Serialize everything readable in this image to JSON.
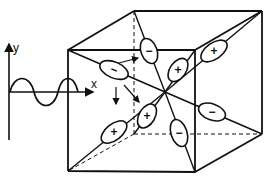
{
  "figure": {
    "axes": {
      "y_label": "y",
      "x_label": "x"
    },
    "wave": {
      "description": "sinusoidal wave propagating along x"
    },
    "cube": {
      "description": "cube with dipoles oriented along body diagonals toward center"
    },
    "dipoles": [
      {
        "id": "front-left",
        "sign": "−"
      },
      {
        "id": "top-back-left",
        "sign": "−"
      },
      {
        "id": "top-inner-right",
        "sign": "+"
      },
      {
        "id": "top-outer-right",
        "sign": "+"
      },
      {
        "id": "bottom-left-outer",
        "sign": "+"
      },
      {
        "id": "bottom-left-inner",
        "sign": "+"
      },
      {
        "id": "bottom-center",
        "sign": "−"
      },
      {
        "id": "right-lower",
        "sign": "−"
      }
    ],
    "colors": {
      "stroke": "#111111",
      "background": "#ffffff"
    }
  }
}
